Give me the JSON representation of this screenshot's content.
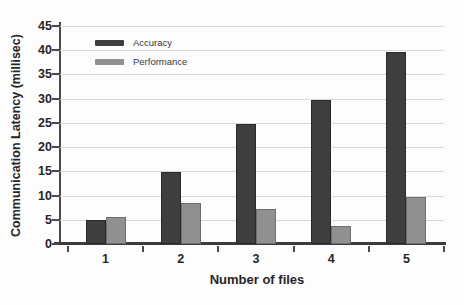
{
  "chart_data": {
    "type": "bar",
    "title": "",
    "xlabel": "Number of files",
    "ylabel": "Communication Latency (millisec)",
    "categories": [
      "1",
      "2",
      "3",
      "4",
      "5"
    ],
    "series": [
      {
        "name": "Accuracy",
        "color": "#3e3e40",
        "border": "#2a2a2c",
        "values": [
          5.0,
          14.9,
          24.8,
          29.7,
          39.7
        ]
      },
      {
        "name": "Performance",
        "color": "#909090",
        "border": "#6e6e6e",
        "values": [
          5.5,
          8.5,
          7.3,
          3.8,
          9.7
        ]
      }
    ],
    "ylim": [
      0,
      45
    ],
    "ytick_step": 5,
    "grid": true,
    "gridline_color": "#d9d9d9",
    "axis_color": "#4a4a4a",
    "text_color": "#262626",
    "legend_position": "top-left-inside"
  }
}
